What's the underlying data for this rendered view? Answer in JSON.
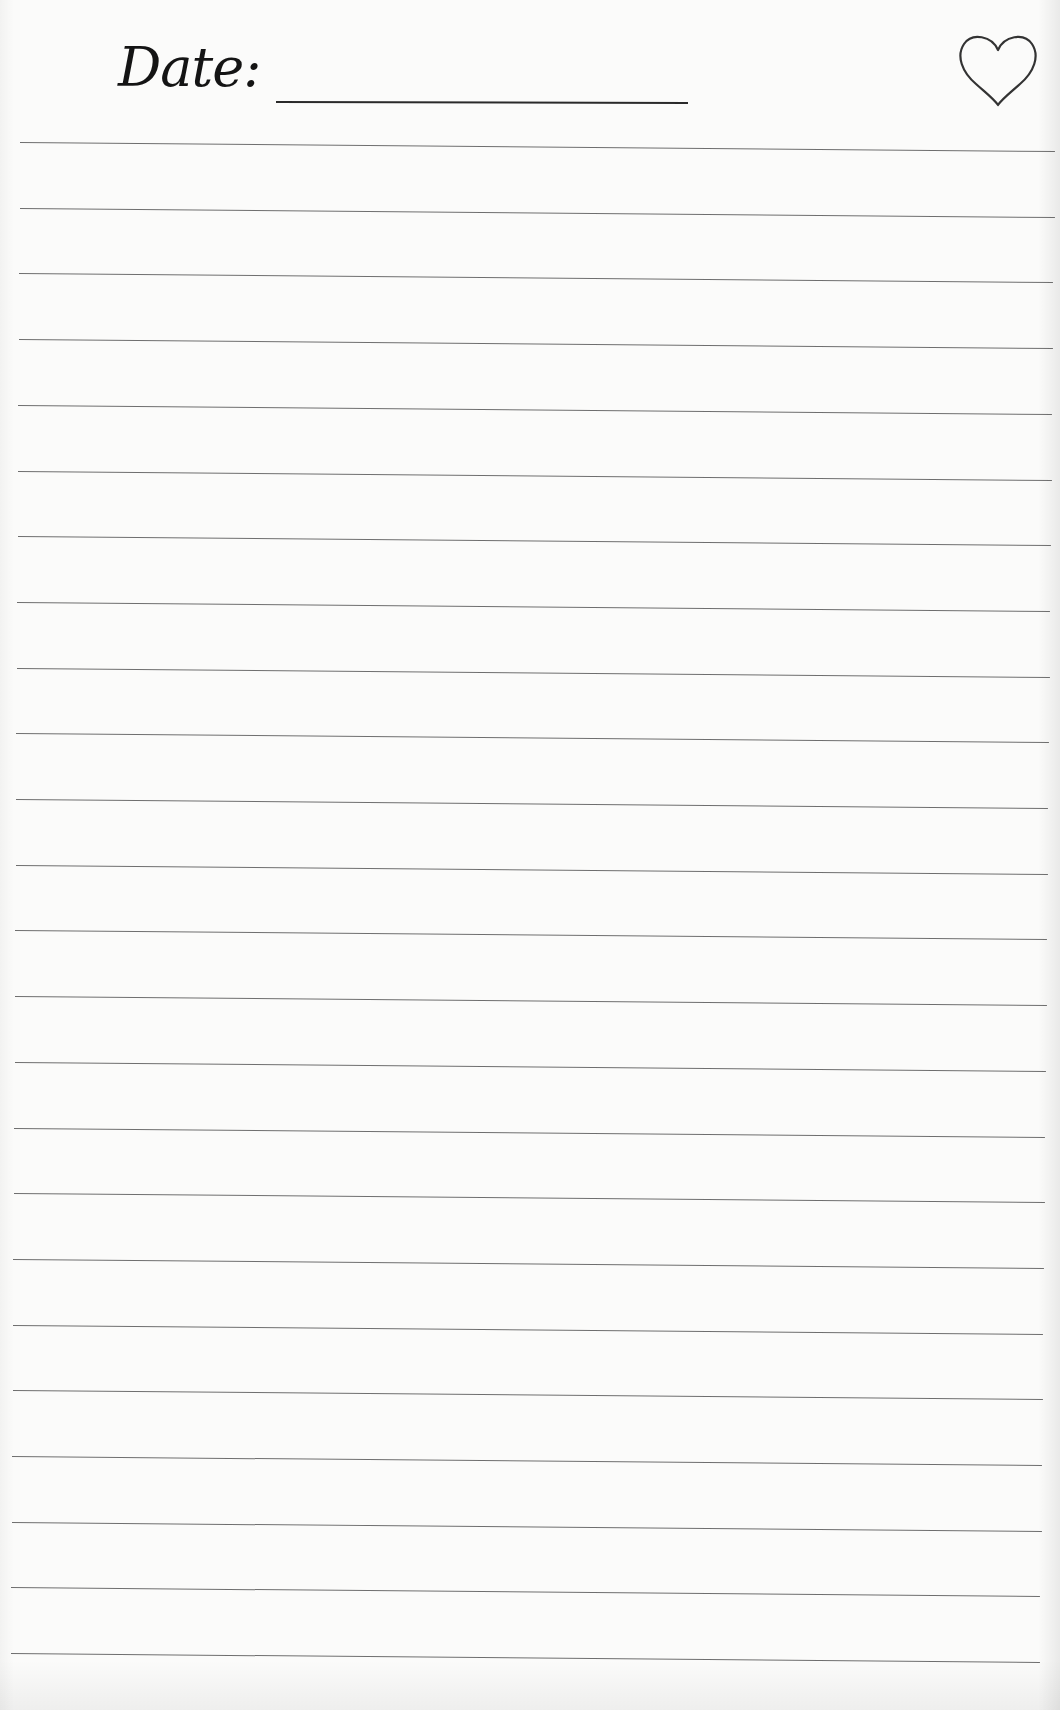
{
  "page": {
    "type": "lined-journal-page",
    "background_color": "#fbfbfa",
    "ink_color": "#141414",
    "rule_color": "#6e6e6e"
  },
  "header": {
    "date_label": "Date:",
    "date_value": "",
    "heart_icon": "heart-outline-icon"
  },
  "rules": {
    "count": 24,
    "first_y": 142,
    "spacing": 65.7,
    "left_start_top": 20,
    "left_start_bottom": 11,
    "right_end_top": 1055,
    "right_end_bottom": 1040
  },
  "body_text": []
}
